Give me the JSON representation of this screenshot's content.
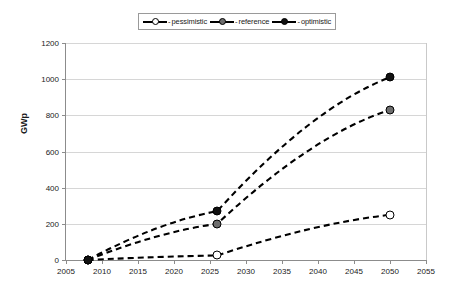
{
  "chart_data": {
    "type": "line",
    "title": "",
    "xlabel": "",
    "ylabel": "GWp",
    "xlim": [
      2005,
      2055
    ],
    "ylim": [
      0,
      1200
    ],
    "xticks": [
      2005,
      2010,
      2015,
      2020,
      2025,
      2030,
      2035,
      2040,
      2045,
      2050,
      2055
    ],
    "yticks": [
      0,
      200,
      400,
      600,
      800,
      1000,
      1200
    ],
    "grid": true,
    "legend_position": "top-center",
    "line_style": "dashed",
    "series": [
      {
        "name": "pessimistic",
        "marker": "open-circle",
        "color": "#ffffff",
        "x": [
          2008,
          2026,
          2050
        ],
        "values": [
          0,
          25,
          250
        ]
      },
      {
        "name": "reference",
        "marker": "gray-circle",
        "color": "#6e6e6e",
        "x": [
          2008,
          2026,
          2050
        ],
        "values": [
          0,
          200,
          830
        ]
      },
      {
        "name": "optimistic",
        "marker": "filled-circle",
        "color": "#111111",
        "x": [
          2008,
          2026,
          2050
        ],
        "values": [
          0,
          270,
          1010
        ]
      }
    ]
  },
  "legend": {
    "separator": "-",
    "entries": [
      {
        "label": "pessimistic"
      },
      {
        "label": "reference"
      },
      {
        "label": "optimistic"
      }
    ]
  },
  "axis": {
    "y_title": "GWp",
    "y_tick_labels": [
      "0",
      "200",
      "400",
      "600",
      "800",
      "1000",
      "1200"
    ],
    "x_tick_labels": [
      "2005",
      "2010",
      "2015",
      "2020",
      "2025",
      "2030",
      "2035",
      "2040",
      "2045",
      "2050",
      "2055"
    ]
  }
}
